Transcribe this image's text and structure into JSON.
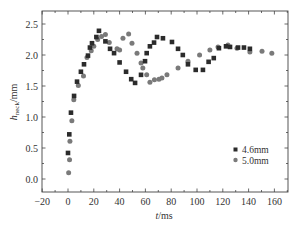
{
  "chart_data": {
    "type": "scatter",
    "title": "",
    "xlabel": "t/ms",
    "xlabel_italic": "t",
    "xlabel_unit": "/ms",
    "ylabel": "h_neck/mm",
    "ylabel_italic": "h",
    "ylabel_sub": "neck",
    "ylabel_unit": "/mm",
    "xlim": [
      -20,
      170
    ],
    "ylim": [
      -0.15,
      2.7
    ],
    "xticks": [
      -20,
      0,
      20,
      40,
      60,
      80,
      100,
      120,
      140,
      160
    ],
    "xtick_labels": [
      "−20",
      "0",
      "20",
      "40",
      "60",
      "80",
      "100",
      "120",
      "140",
      "160"
    ],
    "yticks": [
      0.0,
      0.5,
      1.0,
      1.5,
      2.0,
      2.5
    ],
    "ytick_labels": [
      "0.0",
      "0.5",
      "1.0",
      "1.5",
      "2.0",
      "2.5"
    ],
    "grid": false,
    "legend_position": "lower right",
    "series": [
      {
        "name": "4.6mm",
        "marker": "square",
        "color": "#2b2b2b",
        "points": [
          [
            0,
            0.42
          ],
          [
            1,
            0.72
          ],
          [
            2.3,
            1.07
          ],
          [
            4.7,
            1.34
          ],
          [
            7,
            1.57
          ],
          [
            10,
            1.73
          ],
          [
            12.4,
            1.85
          ],
          [
            15.5,
            1.99
          ],
          [
            17,
            2.12
          ],
          [
            18.6,
            2.19
          ],
          [
            22,
            2.29
          ],
          [
            24,
            2.39
          ],
          [
            29,
            2.22
          ],
          [
            32.6,
            2.1
          ],
          [
            35.7,
            2.03
          ],
          [
            40,
            1.88
          ],
          [
            45,
            1.73
          ],
          [
            49,
            1.61
          ],
          [
            52,
            1.55
          ],
          [
            56.6,
            1.68
          ],
          [
            59.7,
            1.9
          ],
          [
            61,
            2.03
          ],
          [
            63.5,
            2.14
          ],
          [
            66.7,
            2.2
          ],
          [
            69,
            2.29
          ],
          [
            73.6,
            2.27
          ],
          [
            80.6,
            2.21
          ],
          [
            85.3,
            2.1
          ],
          [
            89,
            2.0
          ],
          [
            93,
            1.85
          ],
          [
            99,
            1.76
          ],
          [
            104.6,
            1.76
          ],
          [
            109,
            1.89
          ],
          [
            113,
            1.95
          ],
          [
            117,
            2.11
          ],
          [
            122.5,
            2.14
          ],
          [
            125.6,
            2.13
          ],
          [
            131.8,
            2.12
          ],
          [
            136.4,
            2.12
          ],
          [
            141,
            2.1
          ]
        ]
      },
      {
        "name": "5.0mm",
        "marker": "circle",
        "color": "#7a7a7a",
        "points": [
          [
            0.5,
            0.1
          ],
          [
            1.2,
            0.31
          ],
          [
            1.5,
            0.61
          ],
          [
            3,
            0.94
          ],
          [
            4.5,
            1.28
          ],
          [
            8,
            1.51
          ],
          [
            12,
            1.66
          ],
          [
            14.7,
            1.96
          ],
          [
            18,
            2.07
          ],
          [
            20,
            2.14
          ],
          [
            23,
            2.25
          ],
          [
            26,
            2.3
          ],
          [
            29,
            2.33
          ],
          [
            32,
            2.2
          ],
          [
            38,
            2.1
          ],
          [
            40,
            2.08
          ],
          [
            42.6,
            2.27
          ],
          [
            47,
            2.34
          ],
          [
            49.6,
            2.19
          ],
          [
            53.5,
            2.03
          ],
          [
            56.6,
            1.87
          ],
          [
            58,
            1.79
          ],
          [
            61,
            1.68
          ],
          [
            63.5,
            1.56
          ],
          [
            67,
            1.6
          ],
          [
            70.5,
            1.61
          ],
          [
            72.8,
            1.63
          ],
          [
            76.7,
            1.68
          ],
          [
            85.3,
            1.79
          ],
          [
            93,
            1.9
          ],
          [
            102,
            2.0
          ],
          [
            110,
            2.08
          ],
          [
            116.3,
            2.13
          ],
          [
            124,
            2.16
          ],
          [
            131,
            2.11
          ],
          [
            141,
            2.05
          ],
          [
            150.4,
            2.06
          ],
          [
            158,
            2.03
          ]
        ]
      }
    ]
  }
}
